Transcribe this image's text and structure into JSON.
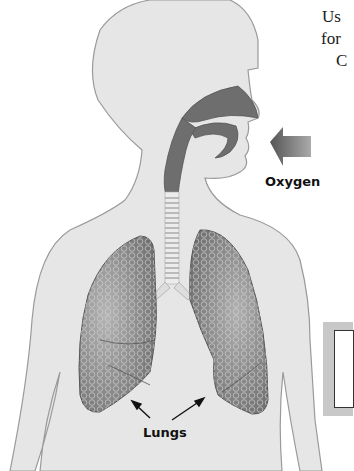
{
  "figure": {
    "labels": {
      "oxygen": "Oxygen",
      "lungs": "Lungs"
    },
    "side_text_fragments": [
      "Us",
      "for",
      "C"
    ]
  },
  "colors": {
    "body_fill": "#e6e6e6",
    "body_outline": "#9a9a9a",
    "airway_fill": "#6e6e6e",
    "lung_fill": "#8a8a8a",
    "arrow_fill": "#7a7a7a",
    "callout_border": "#c8c8c8"
  }
}
